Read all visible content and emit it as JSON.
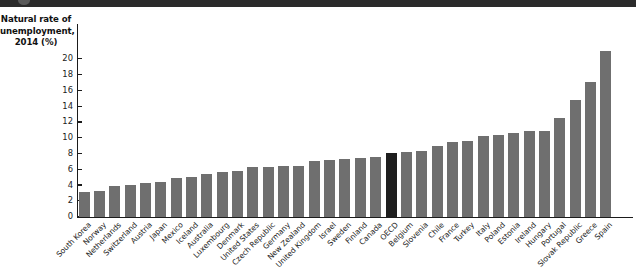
{
  "figure": {
    "axis_title": "Natural rate of unemployment, 2014 (%)",
    "axis_title_lines": [
      "Natural rate of",
      "unemployment,",
      "2014 (%)"
    ]
  },
  "colors": {
    "bar": "#6f6f6f",
    "highlight_bar": "#1e1e1e",
    "axis": "#1b1b1b",
    "background": "#ffffff",
    "page_edge": "#2b2b2b"
  },
  "highlight": {
    "category": "OECD"
  },
  "chart_data": {
    "type": "bar",
    "xlabel": "",
    "ylabel": "Natural rate of unemployment, 2014 (%)",
    "ylim": [
      0,
      21.5
    ],
    "yticks": [
      0,
      2,
      4,
      6,
      8,
      10,
      12,
      14,
      16,
      18,
      20
    ],
    "grid": false,
    "legend": null,
    "categories": [
      "South Korea",
      "Norway",
      "Netherlands",
      "Switzerland",
      "Austria",
      "Japan",
      "Mexico",
      "Iceland",
      "Australia",
      "Luxembourg",
      "Denmark",
      "United States",
      "Czech Republic",
      "Germany",
      "New Zealand",
      "United Kingdom",
      "Israel",
      "Sweden",
      "Finland",
      "Canada",
      "OECD",
      "Belgium",
      "Slovenia",
      "Chile",
      "France",
      "Turkey",
      "Italy",
      "Poland",
      "Estonia",
      "Ireland",
      "Hungary",
      "Portugal",
      "Slovak Republic",
      "Greece",
      "Spain"
    ],
    "values": [
      3.1,
      3.3,
      3.85,
      3.95,
      4.3,
      4.35,
      4.85,
      5.05,
      5.35,
      5.6,
      5.8,
      6.25,
      6.25,
      6.45,
      6.45,
      7.05,
      7.2,
      7.25,
      7.45,
      7.6,
      8.05,
      8.15,
      8.35,
      8.9,
      9.45,
      9.55,
      10.25,
      10.35,
      10.6,
      10.9,
      10.9,
      12.55,
      14.75,
      17.1,
      21.0
    ]
  }
}
